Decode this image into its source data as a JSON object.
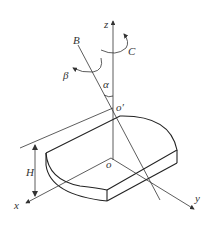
{
  "diagram": {
    "colors": {
      "line": "#333333",
      "background": "#ffffff"
    },
    "labels": {
      "z_axis": "z",
      "x_axis": "x",
      "y_axis": "y",
      "b_axis": "B",
      "c_rotation": "C",
      "beta_rotation": "β",
      "alpha_angle": "α",
      "origin": "o",
      "pivot_origin": "o′",
      "height": "H"
    }
  }
}
